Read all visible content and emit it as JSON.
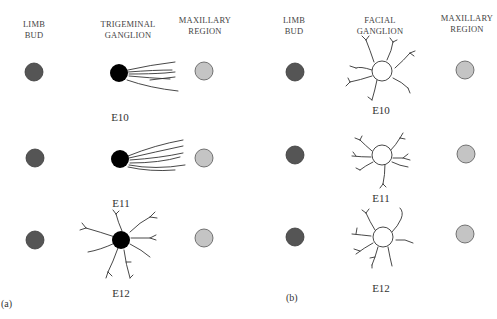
{
  "panels": [
    {
      "id": "a",
      "label": "(a)",
      "columns": [
        "LIMB BUD",
        "TRIGEMINAL GANGLION",
        "MAXILLARY REGION"
      ],
      "column_lines": [
        [
          "LIMB",
          "BUD"
        ],
        [
          "TRIGEMINAL",
          "GANGLION"
        ],
        [
          "MAXILLARY",
          "REGION"
        ]
      ],
      "stages": [
        "E10",
        "E11",
        "E12"
      ]
    },
    {
      "id": "b",
      "label": "(b)",
      "columns": [
        "LIMB BUD",
        "FACIAL GANGLION",
        "MAXILLARY REGION"
      ],
      "column_lines": [
        [
          "LIMB",
          "BUD"
        ],
        [
          "FACIAL",
          "GANGLION"
        ],
        [
          "MAXILLARY",
          "REGION"
        ]
      ],
      "stages": [
        "E10",
        "E11",
        "E12"
      ]
    }
  ],
  "colors": {
    "limb_bud": "#555555",
    "trigeminal_ganglion": "#000000",
    "facial_ganglion": "#ffffff",
    "maxillary_region": "#c4c4c4",
    "neurite": "#333333"
  }
}
